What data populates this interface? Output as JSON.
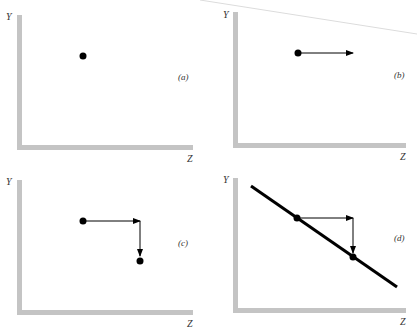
{
  "figure": {
    "header_fragment": "",
    "panels": [
      {
        "id": "a",
        "label": "(a)",
        "y_axis": "Y",
        "x_axis": "Z",
        "description": "single point"
      },
      {
        "id": "b",
        "label": "(b)",
        "y_axis": "Y",
        "x_axis": "Z",
        "description": "point with horizontal arrow to the right"
      },
      {
        "id": "c",
        "label": "(c)",
        "y_axis": "Y",
        "x_axis": "Z",
        "description": "point, horizontal arrow right, then vertical arrow down to second point"
      },
      {
        "id": "d",
        "label": "(d)",
        "y_axis": "Y",
        "x_axis": "Z",
        "description": "downward sloping line through two points connected by right then down arrows"
      }
    ]
  },
  "colors": {
    "axis": "#c4c4c4",
    "ink": "#000000",
    "label": "#333333"
  }
}
